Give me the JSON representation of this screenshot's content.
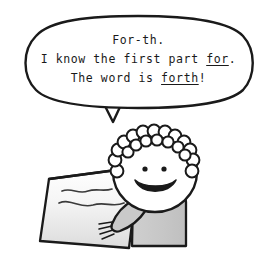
{
  "illustration": {
    "title": "Student reading a word aloud",
    "background_color": "#ffffff",
    "ink_color": "#1a1a1a"
  },
  "speech_bubble": {
    "name": "speech-bubble",
    "shape": "rounded-ellipse-with-tail",
    "fill": "#ffffff",
    "stroke": "#1a1a1a",
    "lines": [
      {
        "id": "line1",
        "plain": "For-th.",
        "segments": [
          {
            "text": "For-th.",
            "underline": false
          }
        ]
      },
      {
        "id": "line2",
        "plain": "I know the first part for.",
        "segments": [
          {
            "text": "I know the first part ",
            "underline": false
          },
          {
            "text": "for",
            "underline": true
          },
          {
            "text": ".",
            "underline": false
          }
        ]
      },
      {
        "id": "line3",
        "plain": "The word is forth!",
        "segments": [
          {
            "text": "The word is ",
            "underline": false
          },
          {
            "text": "forth",
            "underline": true
          },
          {
            "text": "!",
            "underline": false
          }
        ]
      }
    ]
  },
  "character": {
    "name": "child-reader",
    "hair": {
      "style": "curly-ring-of-circles",
      "fill": "#ffffff",
      "stroke": "#1a1a1a"
    },
    "face": {
      "fill": "#ffffff",
      "stroke": "#1a1a1a"
    },
    "eyes": {
      "count": 2,
      "fill": "#1a1a1a"
    },
    "mouth": {
      "expression": "smile",
      "fill": "#1a1a1a"
    },
    "body": {
      "garment": "shirt",
      "fill": "#c9c9c9",
      "stroke": "#1a1a1a"
    },
    "arm": {
      "fill": "#c9c9c9",
      "stroke": "#1a1a1a"
    },
    "hand": {
      "fingers": 4,
      "stroke": "#1a1a1a"
    }
  },
  "paper": {
    "name": "held-paper",
    "shape": "tilted-quadrilateral",
    "fill_top": "#ffffff",
    "fill_bottom": "#dedede",
    "stroke": "#1a1a1a",
    "squiggle_lines": 2
  }
}
